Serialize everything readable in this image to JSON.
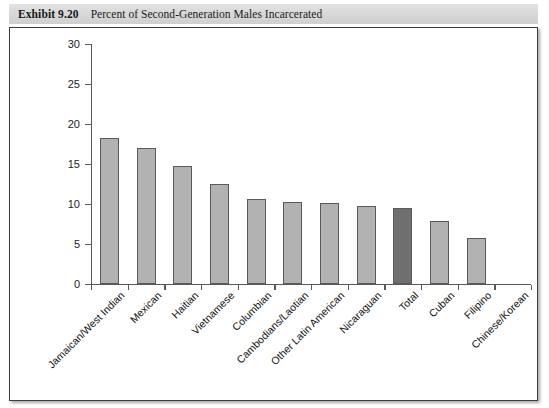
{
  "caption": {
    "label": "Exhibit 9.20",
    "text": "Percent of Second-Generation Males Incarcerated"
  },
  "chart_data": {
    "type": "bar",
    "title": "Percent of Second-Generation Males Incarcerated",
    "xlabel": "",
    "ylabel": "",
    "ylim": [
      0,
      30
    ],
    "yticks": [
      0,
      5,
      10,
      15,
      20,
      25,
      30
    ],
    "grid": false,
    "legend": "none",
    "categories": [
      "Jamaican/West Indian",
      "Mexican",
      "Haitian",
      "Vietnamese",
      "Columbian",
      "Cambodians/Laotian",
      "Other Latin American",
      "Nicaraguan",
      "Total",
      "Cuban",
      "Filipino",
      "Chinese/Korean"
    ],
    "values": [
      18.3,
      17.0,
      14.8,
      12.5,
      10.6,
      10.3,
      10.1,
      9.7,
      9.5,
      7.9,
      5.7,
      0.0
    ],
    "highlight_category": "Total",
    "colors": {
      "bar": "#b2b2b2",
      "bar_highlight": "#6f6f6f",
      "bar_border": "#5a5a5a",
      "axis": "#595959",
      "frame": "#3d3d3d",
      "caption_band": "#d7d7d7",
      "background": "#ffffff"
    }
  }
}
